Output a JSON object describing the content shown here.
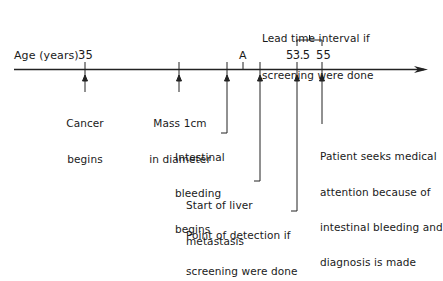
{
  "axis": {
    "label": "Age (years)",
    "ticks": [
      {
        "id": "cancer-begins",
        "label": "35",
        "x": 85
      },
      {
        "id": "mass-1cm",
        "label": "",
        "x": 179
      },
      {
        "id": "intestinal-bleeding",
        "label": "",
        "x": 227
      },
      {
        "id": "point-a",
        "label": "A",
        "x": 243
      },
      {
        "id": "liver-metastasis",
        "label": "",
        "x": 260
      },
      {
        "id": "detection-if-screening",
        "label": "53.5",
        "x": 297
      },
      {
        "id": "diagnosis",
        "label": "55",
        "x": 322
      }
    ]
  },
  "lead_time": {
    "line1": "Lead time interval if",
    "line2": "screening were done"
  },
  "events": {
    "cancer_begins": {
      "line1": "Cancer",
      "line2": "begins"
    },
    "mass": {
      "line1": "Mass 1cm",
      "line2": "in diameter"
    },
    "bleeding": {
      "line1": "Intestinal",
      "line2": "bleeding",
      "line3": "begins"
    },
    "liver": {
      "line1": "Start of liver",
      "line2": "metastasis"
    },
    "detection": {
      "line1": "Point of detection if",
      "line2": "screening were done"
    },
    "diagnosis": {
      "line1": "Patient seeks medical",
      "line2": "attention because of",
      "line3": "intestinal bleeding and",
      "line4": "diagnosis is made"
    }
  },
  "labels": {
    "age_35": "35",
    "a": "A",
    "age_53_5": "53.5",
    "age_55": "55"
  }
}
